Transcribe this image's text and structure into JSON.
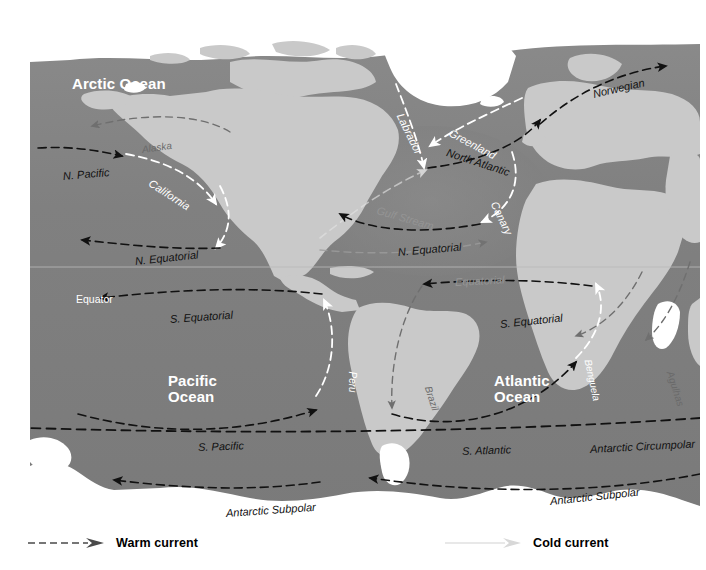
{
  "map": {
    "title": "Ocean Surface Currents",
    "colors": {
      "ocean": "#7e7e7e",
      "ocean_light": "#8d8d8d",
      "land": "#c9c9c9",
      "land_dark": "#a6a6a6",
      "ice": "#ffffff",
      "warm_current": "#ffffff",
      "cold_current": "#111111",
      "background": "#ffffff"
    },
    "ocean_names": [
      {
        "label": "Arctic Ocean",
        "x": 42,
        "y": 40,
        "lines": [
          "Arctic Ocean"
        ]
      },
      {
        "label": "Pacific Ocean",
        "x": 138,
        "y": 337,
        "lines": [
          "Pacific",
          "Ocean"
        ]
      },
      {
        "label": "Atlantic Ocean",
        "x": 464,
        "y": 337,
        "lines": [
          "Atlantic",
          "Ocean"
        ]
      },
      {
        "label": "Southern Ocean",
        "x": 371,
        "y": 482,
        "lines": [
          "Southern Ocean"
        ]
      }
    ],
    "equator": {
      "label": "Equator",
      "x": 46,
      "y": 257
    },
    "currents": [
      {
        "name": "Alaska",
        "type": "warm",
        "style": "faint-dark",
        "x": 112,
        "y": 108,
        "rotate": -8,
        "size": 10
      },
      {
        "name": "N. Pacific",
        "type": "cold",
        "style": "cold",
        "x": 33,
        "y": 134,
        "rotate": -5,
        "size": 11
      },
      {
        "name": "California",
        "type": "cold",
        "style": "warm",
        "x": 120,
        "y": 140,
        "rotate": 33,
        "size": 11
      },
      {
        "name": "N. Equatorial",
        "type": "cold",
        "style": "cold",
        "x": 105,
        "y": 219,
        "rotate": -6,
        "size": 11
      },
      {
        "name": "S. Equatorial",
        "type": "cold",
        "style": "cold",
        "x": 140,
        "y": 277,
        "rotate": -4,
        "size": 11
      },
      {
        "name": "Peru",
        "type": "cold",
        "style": "warm",
        "x": 322,
        "y": 330,
        "rotate": 90,
        "size": 10
      },
      {
        "name": "S. Pacific",
        "type": "cold",
        "style": "cold",
        "x": 168,
        "y": 405,
        "rotate": -2,
        "size": 11
      },
      {
        "name": "Antarctic Subpolar",
        "type": "cold",
        "style": "cold",
        "x": 196,
        "y": 471,
        "rotate": -4,
        "size": 11
      },
      {
        "name": "Labrador",
        "type": "cold",
        "style": "warm",
        "x": 370,
        "y": 72,
        "rotate": 64,
        "size": 11
      },
      {
        "name": "Greenland",
        "type": "cold",
        "style": "warm",
        "x": 420,
        "y": 90,
        "rotate": 28,
        "size": 11
      },
      {
        "name": "North Atlantic",
        "type": "warm",
        "style": "cold",
        "x": 417,
        "y": 110,
        "rotate": 18,
        "size": 11
      },
      {
        "name": "Norwegian",
        "type": "warm",
        "style": "cold",
        "x": 563,
        "y": 52,
        "rotate": -13,
        "size": 11
      },
      {
        "name": "Gulf Stream",
        "type": "warm",
        "style": "faint-light",
        "x": 347,
        "y": 168,
        "rotate": 16,
        "size": 11
      },
      {
        "name": "Canary",
        "type": "cold",
        "style": "warm",
        "x": 464,
        "y": 160,
        "rotate": 64,
        "size": 11
      },
      {
        "name": "N. Equatorial",
        "type": "cold",
        "style": "cold",
        "x": 368,
        "y": 210,
        "rotate": -5,
        "size": 11
      },
      {
        "name": "Equatorial",
        "type": "warm",
        "style": "faint-light",
        "x": 425,
        "y": 240,
        "rotate": -3,
        "size": 11
      },
      {
        "name": "S. Equatorial",
        "type": "cold",
        "style": "cold",
        "x": 470,
        "y": 282,
        "rotate": -6,
        "size": 11
      },
      {
        "name": "Brazil",
        "type": "warm",
        "style": "faint-dark",
        "x": 398,
        "y": 345,
        "rotate": 72,
        "size": 10
      },
      {
        "name": "Benguela",
        "type": "cold",
        "style": "warm",
        "x": 558,
        "y": 318,
        "rotate": 78,
        "size": 10
      },
      {
        "name": "Agulhas",
        "type": "warm",
        "style": "faint-dark",
        "x": 640,
        "y": 330,
        "rotate": 72,
        "size": 10
      },
      {
        "name": "Mozambique",
        "type": "warm",
        "style": "faint-dark",
        "x": 678,
        "y": 330,
        "rotate": 72,
        "size": 10
      },
      {
        "name": "S. Atlantic",
        "type": "cold",
        "style": "cold",
        "x": 432,
        "y": 409,
        "rotate": -2,
        "size": 11
      },
      {
        "name": "Antarctic Circumpolar",
        "type": "cold",
        "style": "cold",
        "x": 560,
        "y": 407,
        "rotate": -3,
        "size": 11
      },
      {
        "name": "Antarctic Subpolar",
        "type": "cold",
        "style": "cold",
        "x": 520,
        "y": 459,
        "rotate": -6,
        "size": 11
      }
    ]
  },
  "legend": {
    "warm": {
      "label": "Warm current",
      "x": 28,
      "arrow": "dashed-arrow-dark"
    },
    "cold": {
      "label": "Cold current",
      "x": 445,
      "arrow": "arrow-light"
    }
  }
}
